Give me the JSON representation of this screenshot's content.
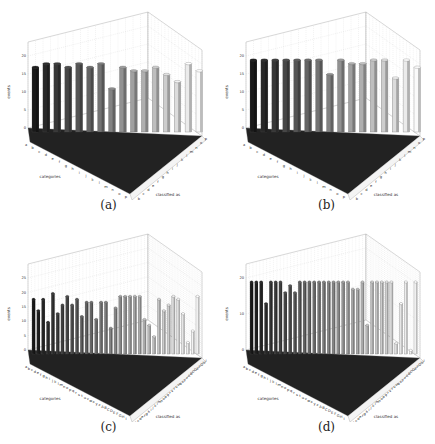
{
  "figure": {
    "panels": [
      {
        "id": "a",
        "caption": "(a)"
      },
      {
        "id": "b",
        "caption": "(b)"
      },
      {
        "id": "c",
        "caption": "(c)"
      },
      {
        "id": "d",
        "caption": "(d)"
      }
    ]
  },
  "chart_data": [
    {
      "panel": "(a)",
      "type": "bar3d",
      "title": "",
      "xlabel": "categories",
      "ylabel": "classified as",
      "zlabel": "events",
      "zlim": [
        0,
        20
      ],
      "zticks": [
        0,
        5,
        10,
        15,
        20
      ],
      "categories": [
        "a",
        "b",
        "c",
        "d",
        "e",
        "f",
        "g",
        "h",
        "i",
        "j",
        "k",
        "l",
        "m",
        "n",
        "o",
        "p"
      ],
      "diagonal_values": [
        18,
        19,
        19,
        18,
        19,
        18,
        19,
        12,
        18,
        17,
        17,
        18,
        16,
        14,
        19,
        17
      ],
      "off_diagonal": "small counts (0-2) scattered",
      "grid": true
    },
    {
      "panel": "(b)",
      "type": "bar3d",
      "title": "",
      "xlabel": "categories",
      "ylabel": "classified as",
      "zlabel": "events",
      "zlim": [
        0,
        20
      ],
      "zticks": [
        0,
        5,
        10,
        15,
        20
      ],
      "categories": [
        "a",
        "b",
        "c",
        "d",
        "e",
        "f",
        "g",
        "h",
        "i",
        "j",
        "k",
        "l",
        "m",
        "n",
        "o",
        "p"
      ],
      "diagonal_values": [
        20,
        20,
        20,
        20,
        20,
        20,
        20,
        16,
        20,
        19,
        19,
        20,
        20,
        15,
        20,
        18
      ],
      "off_diagonal": "small counts (0-2) scattered",
      "grid": true
    },
    {
      "panel": "(c)",
      "type": "bar3d",
      "title": "",
      "xlabel": "categories",
      "ylabel": "classified as",
      "zlabel": "events",
      "zlim": [
        0,
        25
      ],
      "zticks": [
        0,
        5,
        10,
        15,
        20,
        25
      ],
      "categories": [
        "a",
        "b",
        "c",
        "d",
        "e",
        "f",
        "g",
        "h",
        "i",
        "j",
        "k",
        "l",
        "m",
        "n",
        "o",
        "p",
        "q",
        "r",
        "s",
        "t",
        "u",
        "v",
        "w",
        "x",
        "y",
        "z",
        "A",
        "B",
        "C",
        "D",
        "E",
        "F",
        "G",
        "H",
        "I"
      ],
      "diagonal_values": [
        19,
        15,
        19,
        11,
        21,
        14,
        17,
        20,
        17,
        19,
        13,
        18,
        18,
        12,
        18,
        18,
        9,
        16,
        20,
        20,
        20,
        20,
        20,
        12,
        10,
        6,
        19,
        15,
        17,
        20,
        19,
        14,
        4,
        8,
        20
      ],
      "off_diagonal": "small counts (0-5) scattered",
      "grid": true
    },
    {
      "panel": "(d)",
      "type": "bar3d",
      "title": "",
      "xlabel": "categories",
      "ylabel": "classified as",
      "zlabel": "events",
      "zlim": [
        0,
        20
      ],
      "zticks": [
        0,
        10,
        20
      ],
      "categories": [
        "a",
        "b",
        "c",
        "d",
        "e",
        "f",
        "g",
        "h",
        "i",
        "j",
        "k",
        "l",
        "m",
        "n",
        "o",
        "p",
        "q",
        "r",
        "s",
        "t",
        "u",
        "v",
        "w",
        "x",
        "y",
        "z",
        "A",
        "B",
        "C",
        "D",
        "E",
        "F",
        "G",
        "H",
        "I"
      ],
      "diagonal_values": [
        20,
        20,
        20,
        14,
        20,
        20,
        20,
        17,
        19,
        17,
        20,
        20,
        20,
        20,
        20,
        20,
        20,
        20,
        20,
        20,
        20,
        18,
        18,
        20,
        8,
        20,
        20,
        20,
        20,
        20,
        3,
        14,
        20,
        1,
        20
      ],
      "off_diagonal": "small counts (0-3) scattered",
      "grid": true
    }
  ]
}
